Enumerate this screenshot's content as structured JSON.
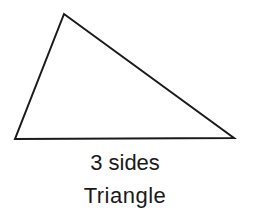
{
  "figure": {
    "shape": "triangle",
    "vertices": [
      [
        64,
        14
      ],
      [
        15,
        139
      ],
      [
        234,
        138
      ]
    ],
    "stroke_color": "#1a1a1a",
    "caption": {
      "line1": "3 sides",
      "line2": "Triangle"
    }
  }
}
